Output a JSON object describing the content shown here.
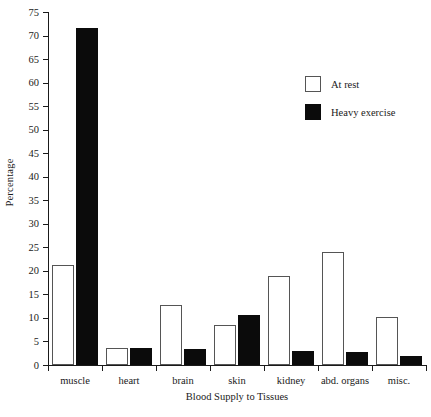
{
  "chart_data": {
    "type": "bar",
    "title": "",
    "xlabel": "Blood Supply to Tissues",
    "ylabel": "Percentage",
    "ylim": [
      0,
      75
    ],
    "ytick_step": 5,
    "yticks": [
      0,
      5,
      10,
      15,
      20,
      25,
      30,
      35,
      40,
      45,
      50,
      55,
      60,
      65,
      70,
      75
    ],
    "ytick_labels": [
      "0",
      "5",
      "10",
      "15",
      "20",
      "25",
      "30",
      "35",
      "40",
      "45",
      "50",
      "55",
      "60",
      "65",
      "70",
      "75"
    ],
    "grid": false,
    "legend_position": "upper right",
    "categories": [
      "muscle",
      "heart",
      "brain",
      "skin",
      "kidney",
      "abd. organs",
      "misc."
    ],
    "series": [
      {
        "name": "At rest",
        "color": "#ffffff",
        "edge_color": "#555555",
        "values": [
          21.2,
          3.7,
          12.8,
          8.6,
          19.0,
          24.0,
          10.1
        ]
      },
      {
        "name": "Heavy exercise",
        "color": "#0b0b0b",
        "edge_color": "#0b0b0b",
        "values": [
          71.5,
          3.7,
          3.4,
          10.6,
          2.9,
          2.7,
          2.0
        ]
      }
    ]
  },
  "legend": {
    "items": [
      {
        "label": "At rest",
        "swatch": "open-square"
      },
      {
        "label": "Heavy exercise",
        "swatch": "filled-square"
      }
    ]
  }
}
